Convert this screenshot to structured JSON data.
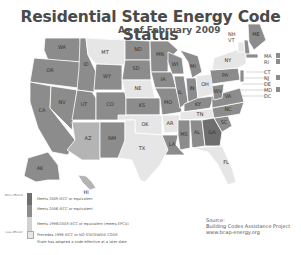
{
  "header": {
    "title": "Residential State Energy Code Status",
    "subtitle": "As of February 2009"
  },
  "colors": {
    "meets_2009": "#6e6e6e",
    "meets_2006": "#8c8c8c",
    "meets_1998_2003": "#b4b4b4",
    "precedes_1998": "#e6e6e6",
    "later_date_hatch": "#9a9a9a",
    "border": "#ffffff",
    "title": "#4a4a4a"
  },
  "legend": {
    "items": [
      {
        "label": "Meets 2009 IECC or equivalent",
        "side_label": "More efficient",
        "color": "#6e6e6e"
      },
      {
        "label": "Meets 2006 IECC or equivalent",
        "color": "#8c8c8c"
      },
      {
        "label": "Meets 1998/2003 IECC or equivalent (meets EPCA)",
        "color": "#b4b4b4"
      },
      {
        "label": "Precedes 1998 IECC or NO STATEWIDE CODE",
        "side_label": "Less efficient",
        "color": "#e6e6e6"
      },
      {
        "label": "State has adopted a code effective at a later date",
        "color": "#9a9a9a"
      }
    ]
  },
  "source": {
    "heading": "Source:",
    "line1": "Building Codes Assistance Project",
    "line2": "www.bcap-energy.org"
  },
  "northeast_callouts": [
    {
      "abbr": "NH",
      "status": "meets_2006"
    },
    {
      "abbr": "VT",
      "status": "meets_1998_2003"
    },
    {
      "abbr": "MA",
      "status": "meets_2006"
    },
    {
      "abbr": "RI",
      "status": "meets_2006"
    },
    {
      "abbr": "CT",
      "status": "meets_1998_2003"
    },
    {
      "abbr": "NJ",
      "status": "meets_2006"
    },
    {
      "abbr": "DE",
      "status": "meets_1998_2003"
    },
    {
      "abbr": "MD",
      "status": "meets_2006"
    },
    {
      "abbr": "DC",
      "status": "meets_2006"
    }
  ],
  "states": [
    {
      "abbr": "WA",
      "status": "meets_2006"
    },
    {
      "abbr": "OR",
      "status": "meets_2006"
    },
    {
      "abbr": "CA",
      "status": "meets_2006"
    },
    {
      "abbr": "ID",
      "status": "meets_2006"
    },
    {
      "abbr": "NV",
      "status": "meets_2006"
    },
    {
      "abbr": "MT",
      "status": "meets_1998_2003"
    },
    {
      "abbr": "WY",
      "status": "precedes_1998"
    },
    {
      "abbr": "UT",
      "status": "meets_2006"
    },
    {
      "abbr": "AZ",
      "status": "precedes_1998"
    },
    {
      "abbr": "CO",
      "status": "precedes_1998"
    },
    {
      "abbr": "NM",
      "status": "meets_2006"
    },
    {
      "abbr": "ND",
      "status": "meets_2006"
    },
    {
      "abbr": "SD",
      "status": "precedes_1998"
    },
    {
      "abbr": "NE",
      "status": "precedes_1998"
    },
    {
      "abbr": "KS",
      "status": "precedes_1998"
    },
    {
      "abbr": "OK",
      "status": "precedes_1998"
    },
    {
      "abbr": "TX",
      "status": "meets_1998_2003"
    },
    {
      "abbr": "MN",
      "status": "meets_2006"
    },
    {
      "abbr": "IA",
      "status": "meets_2006"
    },
    {
      "abbr": "MO",
      "status": "precedes_1998"
    },
    {
      "abbr": "AR",
      "status": "meets_1998_2003"
    },
    {
      "abbr": "LA",
      "status": "meets_2006"
    },
    {
      "abbr": "WI",
      "status": "meets_2006"
    },
    {
      "abbr": "IL",
      "status": "meets_2006"
    },
    {
      "abbr": "MI",
      "status": "meets_2006"
    },
    {
      "abbr": "IN",
      "status": "meets_1998_2003"
    },
    {
      "abbr": "OH",
      "status": "meets_1998_2003"
    },
    {
      "abbr": "KY",
      "status": "meets_2006"
    },
    {
      "abbr": "TN",
      "status": "precedes_1998"
    },
    {
      "abbr": "MS",
      "status": "precedes_1998"
    },
    {
      "abbr": "AL",
      "status": "precedes_1998"
    },
    {
      "abbr": "GA",
      "status": "meets_2006"
    },
    {
      "abbr": "FL",
      "status": "meets_1998_2003"
    },
    {
      "abbr": "SC",
      "status": "meets_2006"
    },
    {
      "abbr": "NC",
      "status": "meets_2006"
    },
    {
      "abbr": "VA",
      "status": "meets_2006"
    },
    {
      "abbr": "WV",
      "status": "meets_1998_2003"
    },
    {
      "abbr": "PA",
      "status": "meets_2006"
    },
    {
      "abbr": "NY",
      "status": "meets_2006"
    },
    {
      "abbr": "ME",
      "status": "meets_2006"
    },
    {
      "abbr": "AK",
      "status": "meets_1998_2003"
    },
    {
      "abbr": "HI",
      "status": "meets_1998_2003"
    }
  ]
}
